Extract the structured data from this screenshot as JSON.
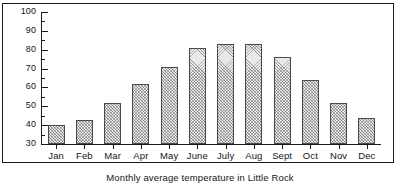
{
  "chart_data": {
    "type": "bar",
    "title": "Monthly average temperature in Little Rock",
    "xlabel": "",
    "ylabel": "",
    "categories": [
      "Jan",
      "Feb",
      "Mar",
      "Apr",
      "May",
      "June",
      "July",
      "Aug",
      "Sept",
      "Oct",
      "Nov",
      "Dec"
    ],
    "values": [
      40,
      43,
      52,
      62,
      71,
      81,
      83,
      83,
      76,
      64,
      52,
      44
    ],
    "ylim": [
      30,
      100
    ],
    "ytick_labels": [
      "30",
      "40",
      "50",
      "60",
      "70",
      "80",
      "90",
      "100"
    ],
    "ytick_values": [
      30,
      40,
      50,
      60,
      70,
      80,
      90,
      100
    ],
    "yminor_step": 5,
    "grid": false,
    "legend": null,
    "bar_fill": "#e8e8e8",
    "bar_edge": "#4a4a4a",
    "axis_color": "#1a1a1a",
    "background": "#ffffff"
  },
  "caption": {
    "text": "Monthly average temperature in Little Rock"
  }
}
